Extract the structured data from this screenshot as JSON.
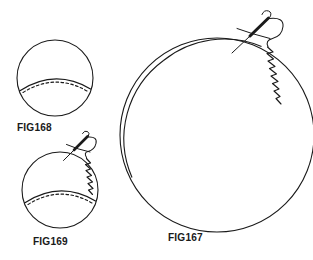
{
  "plate": {
    "title": "Sewing instruction figures 167-169",
    "width": 313,
    "height": 260,
    "background_color": "#ffffff",
    "ink_color": "#1a1a1a",
    "style": "black and white line drawing"
  },
  "figures": [
    {
      "id": "fig168",
      "label": "FIG168",
      "label_x": 17,
      "label_y": 121,
      "description": "small circle of fabric with gathered curved edge at bottom shown as solid arc with dashed running stitch line",
      "circle": {
        "cx": 55,
        "cy": 78,
        "r": 38
      },
      "has_needle": false,
      "has_whipstitch": false,
      "has_bottom_lens": true
    },
    {
      "id": "fig169",
      "label": "FIG169",
      "label_x": 33,
      "label_y": 235,
      "description": "small circle of fabric with gathered curved edge at bottom and needle with thread making whip stitches along the right edge",
      "circle": {
        "cx": 60,
        "cy": 190,
        "r": 38
      },
      "has_needle": true,
      "has_whipstitch": true,
      "has_bottom_lens": true
    },
    {
      "id": "fig167",
      "label": "FIG167",
      "label_x": 168,
      "label_y": 231,
      "description": "large circle of fabric drawn with doubled folded edge and needle with thread making whip stitches along the upper right edge",
      "circle": {
        "cx": 217,
        "cy": 135,
        "r": 97
      },
      "has_needle": true,
      "has_whipstitch": true,
      "has_bottom_lens": false,
      "double_edge": true
    }
  ],
  "colors": {
    "ink": "#1a1a1a",
    "paper": "#ffffff"
  }
}
